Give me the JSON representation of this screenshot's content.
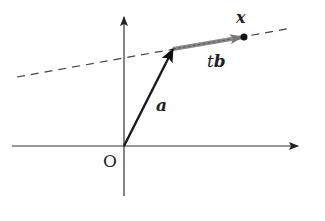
{
  "diagram": {
    "origin_label": "O",
    "vector_a_label": "a",
    "vector_tb_label_t": "t",
    "vector_tb_label_b": "b",
    "point_x_label": "x",
    "colors": {
      "axis": "#333333",
      "vector_a": "#1a1a1a",
      "vector_tb": "#8a8a8a",
      "dashed_line": "#444444",
      "point": "#111111"
    }
  }
}
